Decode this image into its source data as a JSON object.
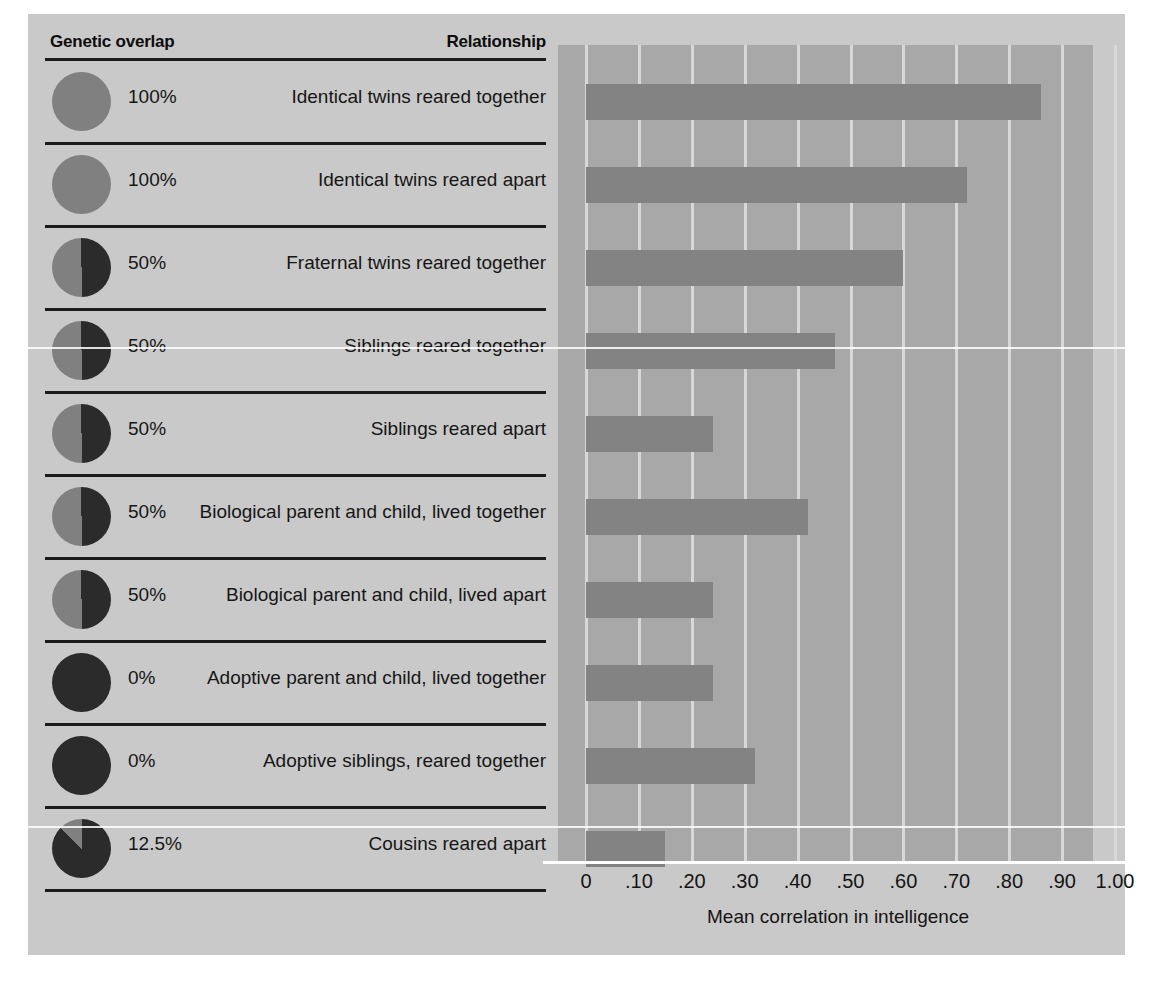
{
  "figure": {
    "background_color": "#c9c9c9",
    "plot_background_color": "#a8a8a8",
    "bar_color": "#838383",
    "gridline_color": "#d8d8d8",
    "pie_dark_color": "#2b2b2b",
    "pie_light_color": "#808080"
  },
  "headers": {
    "genetic_overlap": "Genetic overlap",
    "relationship": "Relationship"
  },
  "chart_data": {
    "type": "bar",
    "orientation": "horizontal",
    "title": "",
    "xlabel": "Mean correlation in intelligence",
    "ylabel": "",
    "xlim": [
      0,
      1.0
    ],
    "xticks": [
      0,
      0.1,
      0.2,
      0.3,
      0.4,
      0.5,
      0.6,
      0.7,
      0.8,
      0.9,
      1.0
    ],
    "xticklabels": [
      "0",
      ".10",
      ".20",
      ".30",
      ".40",
      ".50",
      ".60",
      ".70",
      ".80",
      ".90",
      "1.00"
    ],
    "grid": true,
    "legend": "none",
    "categories": [
      "Identical twins reared together",
      "Identical twins reared apart",
      "Fraternal twins reared together",
      "Siblings reared together",
      "Siblings reared apart",
      "Biological parent and child, lived together",
      "Biological parent and child, lived apart",
      "Adoptive parent and child, lived together",
      "Adoptive siblings, reared together",
      "Cousins reared apart"
    ],
    "values": [
      0.86,
      0.72,
      0.6,
      0.47,
      0.24,
      0.42,
      0.24,
      0.24,
      0.32,
      0.15
    ],
    "genetic_overlap": [
      "100%",
      "100%",
      "50%",
      "50%",
      "50%",
      "50%",
      "50%",
      "0%",
      "0%",
      "12.5%"
    ],
    "genetic_overlap_fraction": [
      1.0,
      1.0,
      0.5,
      0.5,
      0.5,
      0.5,
      0.5,
      0.0,
      0.0,
      0.125
    ]
  },
  "rows": [
    {
      "pct": "100%",
      "frac": 1.0,
      "label": "Identical twins reared together",
      "value": 0.86
    },
    {
      "pct": "100%",
      "frac": 1.0,
      "label": "Identical twins reared apart",
      "value": 0.72
    },
    {
      "pct": "50%",
      "frac": 0.5,
      "label": "Fraternal twins reared together",
      "value": 0.6
    },
    {
      "pct": "50%",
      "frac": 0.5,
      "label": "Siblings reared together",
      "value": 0.47
    },
    {
      "pct": "50%",
      "frac": 0.5,
      "label": "Siblings reared apart",
      "value": 0.24
    },
    {
      "pct": "50%",
      "frac": 0.5,
      "label": "Biological parent and child, lived together",
      "value": 0.42
    },
    {
      "pct": "50%",
      "frac": 0.5,
      "label": "Biological parent and child, lived apart",
      "value": 0.24
    },
    {
      "pct": "0%",
      "frac": 0.0,
      "label": "Adoptive parent and child, lived together",
      "value": 0.24
    },
    {
      "pct": "0%",
      "frac": 0.0,
      "label": "Adoptive siblings, reared together",
      "value": 0.32
    },
    {
      "pct": "12.5%",
      "frac": 0.125,
      "label": "Cousins reared apart",
      "value": 0.15
    }
  ]
}
